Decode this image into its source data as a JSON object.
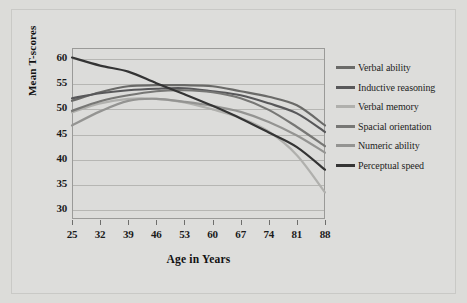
{
  "figure": {
    "background_color": "#dcdcd9",
    "plot_background_color": "#dcdcda",
    "border_color": "#9a9a98",
    "gridline_color": "#b6b6b3"
  },
  "chart_data": {
    "type": "line",
    "title": "",
    "xlabel": "Age in Years",
    "ylabel": "Mean T-scores",
    "x": [
      25,
      32,
      39,
      46,
      53,
      60,
      67,
      74,
      81,
      88
    ],
    "categories": [
      "25",
      "32",
      "39",
      "46",
      "53",
      "60",
      "67",
      "74",
      "81",
      "88"
    ],
    "xlim": [
      25,
      88
    ],
    "ylim": [
      28,
      62
    ],
    "yticks": [
      30,
      35,
      40,
      45,
      50,
      55,
      60
    ],
    "xticks": [
      25,
      32,
      39,
      46,
      53,
      60,
      67,
      74,
      81,
      88
    ],
    "grid": "horizontal",
    "legend_position": "right",
    "series": [
      {
        "name": "Verbal ability",
        "color": "#6a6a68",
        "values": [
          51.5,
          53.2,
          54.4,
          54.6,
          54.6,
          54.4,
          53.4,
          52.3,
          50.6,
          46.6
        ]
      },
      {
        "name": "Inductive reasoning",
        "color": "#58585a",
        "values": [
          52.0,
          53.0,
          53.6,
          53.9,
          54.0,
          53.4,
          52.6,
          51.0,
          49.0,
          45.3
        ]
      },
      {
        "name": "Verbal memory",
        "color": "#b0b0ad",
        "values": [
          49.2,
          51.0,
          51.9,
          51.9,
          51.2,
          49.8,
          48.1,
          45.4,
          40.7,
          33.3
        ]
      },
      {
        "name": "Spacial orientation",
        "color": "#777775",
        "values": [
          49.5,
          51.4,
          52.6,
          53.4,
          53.6,
          53.2,
          52.0,
          49.7,
          46.3,
          42.5
        ]
      },
      {
        "name": "Numeric ability",
        "color": "#949492",
        "values": [
          46.6,
          49.4,
          51.5,
          51.9,
          51.3,
          50.5,
          49.3,
          47.3,
          44.6,
          41.2
        ]
      },
      {
        "name": "Perceptual speed",
        "color": "#343434",
        "values": [
          60.1,
          58.5,
          57.3,
          55.0,
          52.8,
          50.5,
          48.0,
          45.2,
          42.3,
          37.8
        ]
      }
    ]
  },
  "legend": {
    "items": [
      {
        "label": "Verbal ability",
        "color": "#6a6a68"
      },
      {
        "label": "Inductive reasoning",
        "color": "#58585a"
      },
      {
        "label": "Verbal memory",
        "color": "#b0b0ad"
      },
      {
        "label": "Spacial orientation",
        "color": "#777775"
      },
      {
        "label": "Numeric ability",
        "color": "#949492"
      },
      {
        "label": "Perceptual speed",
        "color": "#343434"
      }
    ]
  }
}
